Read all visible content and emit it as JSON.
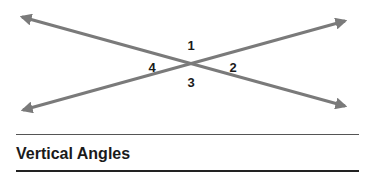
{
  "diagram": {
    "title": "Vertical Angles",
    "line_color": "#7a7a7a",
    "lines": [
      {
        "name": "line-a",
        "x1": 22,
        "y1": 17,
        "x2": 345,
        "y2": 106
      },
      {
        "name": "line-b",
        "x1": 23,
        "y1": 110,
        "x2": 345,
        "y2": 21
      }
    ],
    "intersection": {
      "x": 190,
      "y": 63
    },
    "angle_labels": [
      {
        "text": "1",
        "x": 191,
        "y": 45
      },
      {
        "text": "2",
        "x": 233,
        "y": 67
      },
      {
        "text": "3",
        "x": 191,
        "y": 82
      },
      {
        "text": "4",
        "x": 152,
        "y": 67
      }
    ]
  }
}
